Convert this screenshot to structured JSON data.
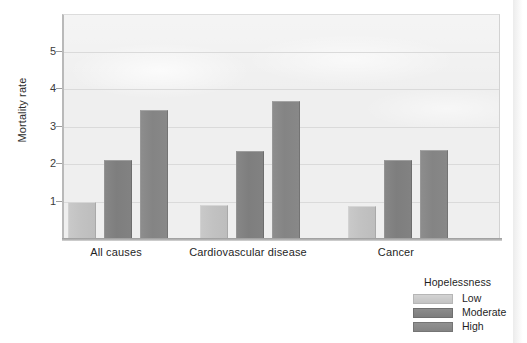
{
  "chart_data": {
    "type": "bar",
    "title": "",
    "xlabel": "",
    "ylabel": "Mortality rate",
    "categories": [
      "All causes",
      "Cardiovascular disease",
      "Cancer"
    ],
    "series": [
      {
        "name": "Low",
        "values": [
          1.0,
          0.92,
          0.87
        ],
        "color": "#c4c4c4"
      },
      {
        "name": "Moderate",
        "values": [
          2.1,
          2.35,
          2.1
        ],
        "color": "#808080"
      },
      {
        "name": "High",
        "values": [
          3.45,
          3.67,
          2.37
        ],
        "color": "#878787"
      }
    ],
    "ylim": [
      0,
      5.9
    ],
    "yticks": [
      1,
      2,
      3,
      4,
      5
    ],
    "ytick_labels": [
      "1",
      "2",
      "3",
      "4",
      "5"
    ],
    "grid": true,
    "legend_position": "bottom-right",
    "legend_title": "Hopelessness"
  },
  "axes": {
    "y_title": "Mortality rate",
    "y_tick_labels": [
      "5",
      "4",
      "3",
      "2",
      "1"
    ],
    "x_tick_labels": [
      "All causes",
      "Cardiovascular disease",
      "Cancer"
    ]
  },
  "legend": {
    "title": "Hopelessness",
    "items": [
      {
        "label": "Low"
      },
      {
        "label": "Moderate"
      },
      {
        "label": "High"
      }
    ]
  },
  "colors": {
    "panel_background": "#efefef",
    "gridline": "#dadada",
    "axis": "#b9b9b9",
    "bar_low": "#c4c4c4",
    "bar_moderate": "#808080",
    "bar_high": "#878787",
    "text": "#1f1f1f"
  }
}
